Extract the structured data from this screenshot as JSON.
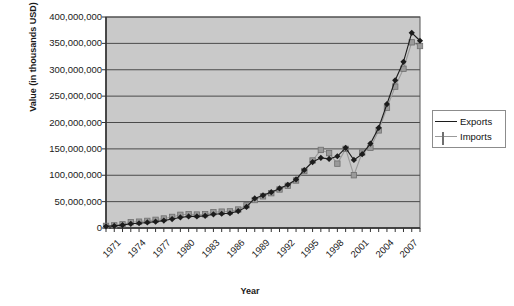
{
  "chart_data": {
    "type": "line",
    "title": "",
    "xlabel": "Year",
    "ylabel": "Value (in thousands USD)",
    "ylim": [
      0,
      400000000
    ],
    "ytick_values": [
      0,
      50000000,
      100000000,
      150000000,
      200000000,
      250000000,
      300000000,
      350000000,
      400000000
    ],
    "ytick_labels": [
      "0",
      "50,000,000",
      "100,000,000",
      "150,000,000",
      "200,000,000",
      "250,000,000",
      "300,000,000",
      "350,000,000",
      "400,000,000"
    ],
    "x": [
      1971,
      1972,
      1973,
      1974,
      1975,
      1976,
      1977,
      1978,
      1979,
      1980,
      1981,
      1982,
      1983,
      1984,
      1985,
      1986,
      1987,
      1988,
      1989,
      1990,
      1991,
      1992,
      1993,
      1994,
      1995,
      1996,
      1997,
      1998,
      1999,
      2000,
      2001,
      2002,
      2003,
      2004,
      2005,
      2006,
      2007,
      2008,
      2009
    ],
    "xtick_labels": [
      "1971",
      "1974",
      "1977",
      "1980",
      "1983",
      "1986",
      "1989",
      "1992",
      "1995",
      "1998",
      "2001",
      "2004",
      "2007"
    ],
    "xtick_step": 3,
    "grid": true,
    "legend_position": "right",
    "series": [
      {
        "name": "Exports",
        "marker": "diamond",
        "color": "#1c1c1c",
        "values": [
          3000000,
          4000000,
          5500000,
          8000000,
          9000000,
          10500000,
          12000000,
          14000000,
          17000000,
          20000000,
          22000000,
          22000000,
          23000000,
          26000000,
          27000000,
          28000000,
          32000000,
          40000000,
          56000000,
          62000000,
          68000000,
          75000000,
          82000000,
          92000000,
          110000000,
          125000000,
          133000000,
          131000000,
          136000000,
          152000000,
          129000000,
          140000000,
          160000000,
          190000000,
          235000000,
          280000000,
          315000000,
          370000000,
          355000000
        ]
      },
      {
        "name": "Imports",
        "marker": "square",
        "color": "#9a9a9a",
        "values": [
          4000000,
          5000000,
          7000000,
          11000000,
          12000000,
          13500000,
          15500000,
          18000000,
          21000000,
          25000000,
          26000000,
          25500000,
          26000000,
          30000000,
          31000000,
          31500000,
          35000000,
          43000000,
          53000000,
          60000000,
          66000000,
          73000000,
          80000000,
          90000000,
          108000000,
          128000000,
          148000000,
          142000000,
          122000000,
          150000000,
          100000000,
          143000000,
          152000000,
          185000000,
          228000000,
          268000000,
          302000000,
          352000000,
          345000000
        ]
      }
    ]
  },
  "legend": {
    "items": [
      {
        "label": "Exports"
      },
      {
        "label": "Imports"
      }
    ]
  }
}
